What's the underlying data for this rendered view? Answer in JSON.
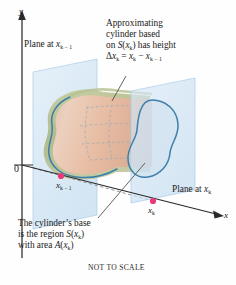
{
  "figure": {
    "caption": "NOT TO SCALE",
    "axes": {
      "y_label": "y",
      "x_label": "x",
      "origin_label": "0"
    },
    "points": [
      {
        "name": "x_k_minus_1",
        "label_main": "x",
        "label_sub": "k − 1",
        "color": "#e8397c",
        "cx": 61,
        "cy": 176
      },
      {
        "name": "x_k",
        "label_main": "x",
        "label_sub": "k",
        "color": "#e8397c",
        "cx": 153,
        "cy": 201
      }
    ],
    "annotations": {
      "plane_left": {
        "text": "Plane at ",
        "var_main": "x",
        "var_sub": "k − 1"
      },
      "plane_right": {
        "text": "Plane at ",
        "var_main": "x",
        "var_sub": "k"
      },
      "approx_cylinder": {
        "line1": "Approximating",
        "line2": "cylinder based",
        "line3_a": "on ",
        "line3_var": "S",
        "line3_b": "(",
        "line3_sub_main": "x",
        "line3_sub_k": "k",
        "line3_c": ") has height",
        "line4_delta": "Δ",
        "line4_x": "x",
        "line4_sub1": "k",
        "line4_eq": " = ",
        "line4_x2": "x",
        "line4_sub2": "k",
        "line4_minus": " − ",
        "line4_x3": "x",
        "line4_sub3": "k − 1"
      },
      "cylinder_base": {
        "line1": "The cylinder’s base",
        "line2_a": "is the region ",
        "line2_s": "S",
        "line2_b": "(",
        "line2_x": "x",
        "line2_k": "k",
        "line2_c": ")",
        "line3_a": "with area ",
        "line3_s": "A",
        "line3_b": "(",
        "line3_x": "x",
        "line3_k": "k",
        "line3_c": ")"
      }
    },
    "colors": {
      "plane_fill": "#cfe3f2",
      "plane_stroke": "#b9d6ec",
      "cylinder_body": "#e8c0a8",
      "cylinder_rim": "#b9bf8e",
      "outline_blue": "#3c7fa8",
      "point_pink": "#e8397c",
      "axis": "#2b2b2b"
    }
  }
}
